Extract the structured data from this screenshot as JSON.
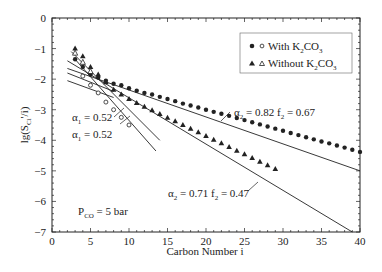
{
  "chart_data": {
    "type": "scatter",
    "title": "",
    "xlabel": "Carbon Number i",
    "ylabel": "lg(S_Ci'/i)",
    "xlim": [
      0,
      40
    ],
    "ylim": [
      -7,
      0
    ],
    "xticks": [
      0,
      5,
      10,
      15,
      20,
      25,
      30,
      35,
      40
    ],
    "yticks": [
      0,
      -1,
      -2,
      -3,
      -4,
      -5,
      -6,
      -7
    ],
    "grid": false,
    "legend_position": "upper right",
    "legend": [
      {
        "filled": "circle",
        "open": "circle",
        "label": "With K2CO3"
      },
      {
        "filled": "triangle",
        "open": "triangle",
        "label": "Without K2CO3"
      }
    ],
    "annotations": [
      {
        "text": "α1 = 0.52",
        "x": 10,
        "y": -3.2
      },
      {
        "text": "α1 = 0.52",
        "x": 10,
        "y": -3.8
      },
      {
        "text": "α2 = 0.82  f2 = 0.67",
        "x": 24,
        "y": -2.95
      },
      {
        "text": "α2 = 0.71 f2 = 0.47",
        "x": 18,
        "y": -5.4
      },
      {
        "text": "PCO = 5 bar",
        "x": 4,
        "y": -6.3
      }
    ],
    "series": [
      {
        "name": "With K2CO3 (filled circles)",
        "marker": "filled-circle",
        "x": [
          3,
          4,
          5,
          6,
          7,
          8,
          9,
          10,
          11,
          12,
          13,
          14,
          15,
          16,
          17,
          18,
          19,
          20,
          21,
          22,
          23,
          24,
          25,
          26,
          27,
          28,
          29,
          30,
          31,
          32,
          33,
          34,
          35,
          36,
          37,
          38,
          39,
          40
        ],
        "y": [
          -1.35,
          -1.6,
          -1.85,
          -1.95,
          -2.05,
          -2.15,
          -2.2,
          -2.3,
          -2.38,
          -2.45,
          -2.5,
          -2.58,
          -2.65,
          -2.72,
          -2.8,
          -2.86,
          -2.93,
          -3.0,
          -3.07,
          -3.13,
          -3.2,
          -3.27,
          -3.34,
          -3.41,
          -3.48,
          -3.55,
          -3.62,
          -3.69,
          -3.76,
          -3.83,
          -3.9,
          -3.97,
          -4.04,
          -4.1,
          -4.17,
          -4.24,
          -4.31,
          -4.38
        ]
      },
      {
        "name": "With K2CO3 (open circles)",
        "marker": "open-circle",
        "x": [
          4,
          5,
          6,
          7,
          8,
          9,
          10
        ],
        "y": [
          -1.9,
          -2.2,
          -2.45,
          -2.75,
          -3.0,
          -3.25,
          -3.5
        ]
      },
      {
        "name": "Without K2CO3 (filled triangles)",
        "marker": "filled-triangle",
        "x": [
          3,
          4,
          5,
          6,
          7,
          8,
          9,
          10,
          11,
          12,
          13,
          14,
          15,
          16,
          17,
          18,
          19,
          20,
          21,
          22,
          23,
          24,
          25,
          26,
          27,
          28,
          29
        ],
        "y": [
          -1.0,
          -1.25,
          -1.6,
          -1.85,
          -2.1,
          -2.35,
          -2.5,
          -2.65,
          -2.78,
          -2.9,
          -3.02,
          -3.14,
          -3.26,
          -3.38,
          -3.5,
          -3.62,
          -3.74,
          -3.86,
          -3.98,
          -4.1,
          -4.22,
          -4.34,
          -4.46,
          -4.58,
          -4.7,
          -4.82,
          -4.94
        ]
      },
      {
        "name": "Without K2CO3 (open triangles)",
        "marker": "open-triangle",
        "x": [
          3,
          4,
          5
        ],
        "y": [
          -1.15,
          -1.45,
          -1.75
        ]
      }
    ],
    "fit_lines": [
      {
        "label": "α2 = 0.82 f2 = 0.67",
        "x": [
          2,
          40
        ],
        "y": [
          -1.65,
          -5.0
        ]
      },
      {
        "label": "α2 = 0.71 f2 = 0.47",
        "x": [
          2,
          39
        ],
        "y": [
          -1.4,
          -7.0
        ]
      },
      {
        "label": "α1 = 0.52 (a)",
        "x": [
          2.5,
          14
        ],
        "y": [
          -1.1,
          -4.0
        ]
      },
      {
        "label": "α1 = 0.52 (b)",
        "x": [
          3,
          13.5
        ],
        "y": [
          -1.35,
          -4.35
        ]
      },
      {
        "label": "short line 1",
        "x": [
          2,
          8
        ],
        "y": [
          -1.8,
          -2.4
        ]
      },
      {
        "label": "short line 2",
        "x": [
          2,
          8
        ],
        "y": [
          -2.05,
          -2.6
        ]
      }
    ]
  },
  "labels": {
    "xlabel": "Carbon Number i",
    "ylabel_main": "lg(S",
    "ylabel_sub": "Ci",
    "ylabel_tail": "'/i)",
    "legend_with": "With K",
    "legend_without": "Without K",
    "legend_sub2": "2",
    "legend_co": "CO",
    "legend_sub3": "3",
    "ann_a1_top": "α",
    "ann_a1_val": " = 0.52",
    "ann_a2_top": "α",
    "ann_a2_text": " = 0.82  f",
    "ann_a2_val": " = 0.67",
    "ann_a2b_text": " = 0.71 f",
    "ann_a2b_val": " = 0.47",
    "sub1": "1",
    "sub2": "2",
    "pco_p": "P",
    "pco_sub": "CO",
    "pco_val": " = 5 bar"
  }
}
